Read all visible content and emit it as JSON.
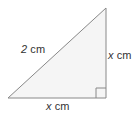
{
  "figure": {
    "background_color": "#ffffff",
    "shape": {
      "name": "right-triangle",
      "fill_color": "#f5f5f5",
      "stroke_color": "#888888",
      "stroke_width": 1,
      "vertices": {
        "bottom_left": {
          "x": 8,
          "y": 98
        },
        "bottom_right": {
          "x": 106,
          "y": 98
        },
        "top_right": {
          "x": 106,
          "y": 8
        }
      }
    },
    "right_angle_marker": {
      "name": "right-angle-square",
      "corner": "bottom-right",
      "size": 10,
      "stroke_color": "#888888"
    },
    "labels": {
      "hypotenuse": {
        "value": "2",
        "unit": "cm",
        "full_text": "2 cm",
        "italic_part": "",
        "color": "#333333"
      },
      "vertical_leg": {
        "value": "x",
        "unit": "cm",
        "full_text": "x cm",
        "italic_part": "x",
        "color": "#333333"
      },
      "horizontal_leg": {
        "value": "x",
        "unit": "cm",
        "full_text": "x cm",
        "italic_part": "x",
        "color": "#333333"
      }
    }
  }
}
